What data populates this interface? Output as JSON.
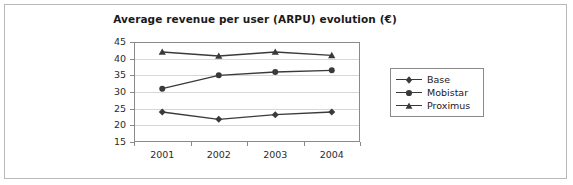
{
  "chart_data": {
    "type": "line",
    "title": "Average revenue per user (ARPU) evolution (€)",
    "xlabel": "",
    "ylabel": "",
    "categories": [
      "2001",
      "2002",
      "2003",
      "2004"
    ],
    "ylim": [
      15,
      45
    ],
    "yticks": [
      15,
      20,
      25,
      30,
      35,
      40,
      45
    ],
    "grid": true,
    "legend_position": "right",
    "series": [
      {
        "name": "Base",
        "marker": "diamond",
        "color": "#3a3a3a",
        "values": [
          24.0,
          21.8,
          23.2,
          24.0
        ]
      },
      {
        "name": "Mobistar",
        "marker": "circle",
        "color": "#3a3a3a",
        "values": [
          31.0,
          35.0,
          36.0,
          36.5
        ]
      },
      {
        "name": "Proximus",
        "marker": "triangle",
        "color": "#3a3a3a",
        "values": [
          42.0,
          40.8,
          42.0,
          41.0
        ]
      }
    ]
  },
  "legend": {
    "entries": [
      {
        "label": "Base"
      },
      {
        "label": "Mobistar"
      },
      {
        "label": "Proximus"
      }
    ]
  }
}
